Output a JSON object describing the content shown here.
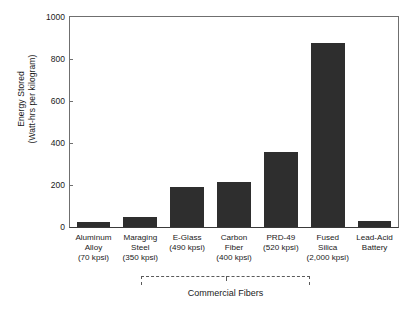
{
  "chart_data": {
    "type": "bar",
    "title": "",
    "xlabel": "Commercial Fibers",
    "ylabel": "Energy Stored\n(Watt-hrs per kilogram)",
    "categories": [
      "Aluminum\nAlloy\n(70 kpsi)",
      "Maraging\nSteel\n(350 kpsi)",
      "E-Glass\n(490 kpsi)",
      "Carbon\nFiber\n(400 kpsi)",
      "PRD-49\n(520 kpsi)",
      "Fused\nSilica\n(2,000 kpsi)",
      "Lead-Acid\nBattery"
    ],
    "values": [
      25,
      50,
      190,
      215,
      355,
      875,
      30
    ],
    "ylim": [
      0,
      1000
    ],
    "yticks": [
      0,
      200,
      400,
      600,
      800,
      1000
    ],
    "ytick_labels": [
      "0",
      "200",
      "400",
      "600",
      "800",
      "1000"
    ],
    "grid": false,
    "legend": false,
    "bar_color": "#2e2e2e",
    "axis_color": "#6f6f6f",
    "group_annotation": {
      "label": "Commercial Fibers",
      "spans_categories": [
        "E-Glass\n(490 kpsi)",
        "Carbon\nFiber\n(400 kpsi)",
        "PRD-49\n(520 kpsi)",
        "Fused\nSilica\n(2,000 kpsi)"
      ]
    }
  }
}
